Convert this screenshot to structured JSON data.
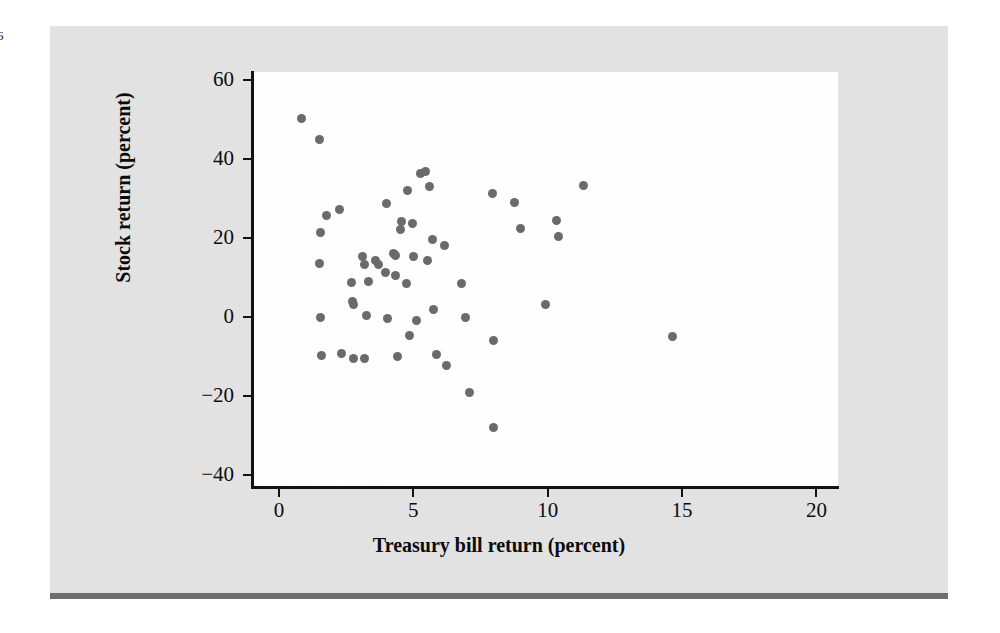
{
  "page": {
    "folio": "6",
    "background_color": "#ffffff",
    "panel_color": "#e3e3e3",
    "rule_color": "#6e6e6e"
  },
  "chart_data": {
    "type": "scatter",
    "title": "",
    "xlabel": "Treasury bill return (percent)",
    "ylabel": "Stock return (percent)",
    "xlim": [
      -1.0,
      20.8
    ],
    "ylim": [
      -43,
      62
    ],
    "xticks": [
      0,
      5,
      10,
      15,
      20
    ],
    "xtick_labels": [
      "0",
      "5",
      "10",
      "15",
      "20"
    ],
    "yticks": [
      -40,
      -20,
      0,
      20,
      40,
      60
    ],
    "ytick_labels": [
      "−40",
      "−20",
      "0",
      "20",
      "40",
      "60"
    ],
    "grid": false,
    "legend": false,
    "marker": {
      "shape": "circle",
      "color": "#6b6b6b",
      "size_px": 9
    },
    "n_points": 56,
    "points": [
      {
        "x": 0.85,
        "y": 50.3
      },
      {
        "x": 1.52,
        "y": 44.9
      },
      {
        "x": 1.78,
        "y": 25.8
      },
      {
        "x": 1.55,
        "y": 21.4
      },
      {
        "x": 1.52,
        "y": 13.6
      },
      {
        "x": 1.55,
        "y": -0.2
      },
      {
        "x": 1.58,
        "y": -9.7
      },
      {
        "x": 2.26,
        "y": 27.2
      },
      {
        "x": 2.33,
        "y": -9.2
      },
      {
        "x": 2.7,
        "y": 8.8
      },
      {
        "x": 2.74,
        "y": 4.0
      },
      {
        "x": 2.78,
        "y": 3.1
      },
      {
        "x": 2.78,
        "y": -10.4
      },
      {
        "x": 3.2,
        "y": 13.4
      },
      {
        "x": 3.12,
        "y": 15.3
      },
      {
        "x": 3.25,
        "y": 0.3
      },
      {
        "x": 3.2,
        "y": -10.4
      },
      {
        "x": 3.33,
        "y": 8.9
      },
      {
        "x": 3.6,
        "y": 14.2
      },
      {
        "x": 3.7,
        "y": 13.2
      },
      {
        "x": 4.0,
        "y": 28.8
      },
      {
        "x": 3.96,
        "y": 11.2
      },
      {
        "x": 4.05,
        "y": -0.3
      },
      {
        "x": 4.28,
        "y": 16.2
      },
      {
        "x": 4.33,
        "y": 15.6
      },
      {
        "x": 4.35,
        "y": 10.4
      },
      {
        "x": 4.42,
        "y": -10.0
      },
      {
        "x": 4.52,
        "y": 22.1
      },
      {
        "x": 4.58,
        "y": 24.1
      },
      {
        "x": 4.78,
        "y": 32.1
      },
      {
        "x": 4.74,
        "y": 8.4
      },
      {
        "x": 4.85,
        "y": -4.6
      },
      {
        "x": 4.96,
        "y": 23.6
      },
      {
        "x": 5.0,
        "y": 15.2
      },
      {
        "x": 5.12,
        "y": -0.8
      },
      {
        "x": 5.28,
        "y": 36.3
      },
      {
        "x": 5.44,
        "y": 36.9
      },
      {
        "x": 5.52,
        "y": 14.4
      },
      {
        "x": 5.62,
        "y": 33.0
      },
      {
        "x": 5.7,
        "y": 19.6
      },
      {
        "x": 5.74,
        "y": 1.8
      },
      {
        "x": 5.85,
        "y": -9.4
      },
      {
        "x": 6.15,
        "y": 18.0
      },
      {
        "x": 6.22,
        "y": -12.2
      },
      {
        "x": 6.78,
        "y": 8.5
      },
      {
        "x": 6.96,
        "y": -0.2
      },
      {
        "x": 7.08,
        "y": -19.2
      },
      {
        "x": 7.93,
        "y": 31.2
      },
      {
        "x": 8.0,
        "y": -6.0
      },
      {
        "x": 8.0,
        "y": -28.0
      },
      {
        "x": 8.78,
        "y": 28.9
      },
      {
        "x": 9.0,
        "y": 22.4
      },
      {
        "x": 9.93,
        "y": 3.2
      },
      {
        "x": 10.33,
        "y": 24.4
      },
      {
        "x": 10.4,
        "y": 20.3
      },
      {
        "x": 11.33,
        "y": 33.2
      },
      {
        "x": 14.66,
        "y": -4.8
      }
    ]
  }
}
